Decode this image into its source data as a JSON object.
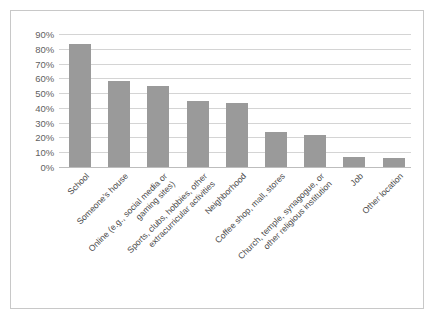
{
  "chart_data": {
    "type": "bar",
    "title": "",
    "xlabel": "",
    "ylabel": "",
    "ylim": [
      0,
      90
    ],
    "grid": true,
    "legend": false,
    "bar_color": "#9a9a9a",
    "ytick_labels": [
      "90%",
      "80%",
      "70%",
      "60%",
      "50%",
      "40%",
      "30%",
      "20%",
      "10%",
      "0%"
    ],
    "ytick_values": [
      90,
      80,
      70,
      60,
      50,
      40,
      30,
      20,
      10,
      0
    ],
    "categories": [
      "School",
      "Someone's house",
      "Online (e.g., social media or gaming sites)",
      "Sports, clubs, hobbies, other extracurricular activities",
      "Neighborhood",
      "Coffee shop, mall, stores",
      "Church, temple, synagogue, or other religious institution",
      "Job",
      "Other location"
    ],
    "category_lines": [
      [
        "School"
      ],
      [
        "Someone's house"
      ],
      [
        "Online (e.g., social media or",
        "gaming sites)"
      ],
      [
        "Sports, clubs, hobbies, other",
        "extracurricular activities"
      ],
      [
        "Neighborhood"
      ],
      [
        "Coffee shop, mall, stores"
      ],
      [
        "Church, temple, synagogue, or",
        "other religious institution"
      ],
      [
        "Job"
      ],
      [
        "Other location"
      ]
    ],
    "values": [
      83,
      58,
      55,
      45,
      43,
      24,
      22,
      7,
      6
    ]
  }
}
